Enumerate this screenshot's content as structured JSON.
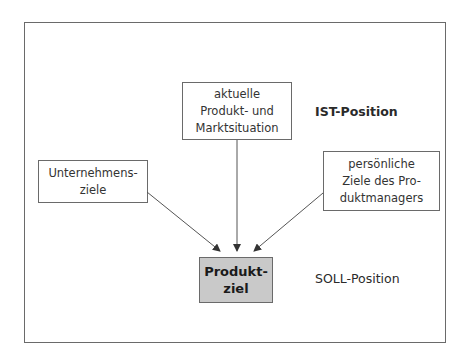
{
  "diagram": {
    "type": "flow",
    "sources": [
      {
        "id": "market",
        "text": "aktuelle\nProdukt- und\nMarktsituation"
      },
      {
        "id": "company",
        "text": "Unternehmens-\nziele"
      },
      {
        "id": "manager",
        "text": "persönliche\nZiele des Pro-\nduktmanagers"
      }
    ],
    "target": {
      "id": "goal",
      "text": "Produkt-\nziel"
    },
    "edges": [
      {
        "from": "company",
        "to": "goal"
      },
      {
        "from": "market",
        "to": "goal"
      },
      {
        "from": "manager",
        "to": "goal"
      }
    ],
    "labels": {
      "ist": "IST-Position",
      "soll": "SOLL-Position"
    },
    "colors": {
      "line": "#555555",
      "goal_fill": "#c9c9c9",
      "border": "#6a6a6a"
    }
  }
}
